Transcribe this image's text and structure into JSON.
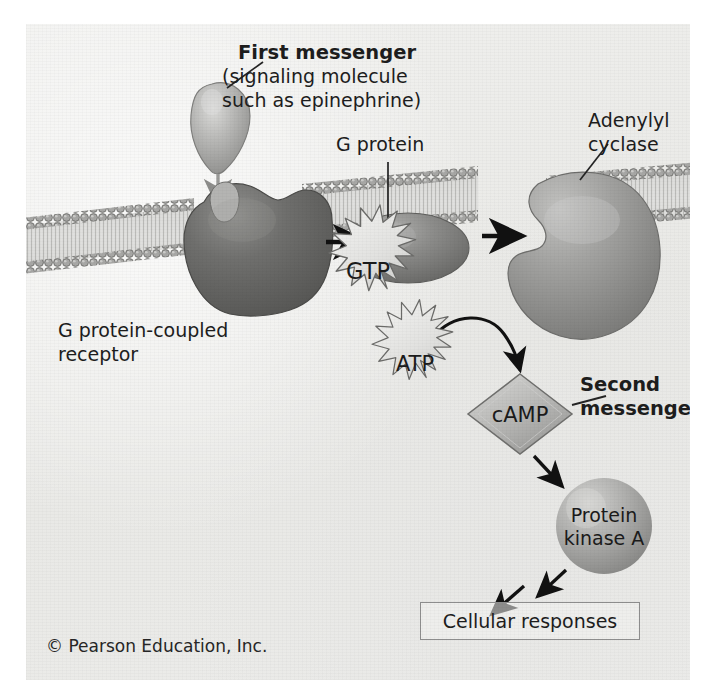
{
  "figure": {
    "background_color": "#eeeeec",
    "ink_color": "#1d1d1d"
  },
  "labels": {
    "first_messenger": {
      "line1": "First messenger",
      "line2": "(signaling molecule",
      "line3": "such as epinephrine)",
      "bold": "true"
    },
    "g_protein": "G protein",
    "adenylyl_cyclase": {
      "line1": "Adenylyl",
      "line2": "cyclase"
    },
    "receptor": {
      "line1": "G protein-coupled",
      "line2": "receptor"
    },
    "second_messenger": {
      "line1": "Second",
      "line2": "messenger",
      "bold": "true"
    },
    "cellular_responses": "Cellular responses",
    "copyright": "© Pearson Education, Inc."
  },
  "molecules": {
    "gtp": "GTP",
    "atp": "ATP",
    "camp": "cAMP",
    "protein_kinase_a": {
      "line1": "Protein",
      "line2": "kinase A"
    }
  },
  "colors": {
    "receptor_fill": "#6e6e6e",
    "g_protein_fill": "#8a8a8a",
    "adenylyl_cyclase_fill": "#9a9a9a",
    "ligand_fill": "#b4b4b4",
    "starburst_fill": "#e6e6e4",
    "camp_fill": "#b9b9b7",
    "kinase_fill": "#b0b0ae",
    "membrane_head": "#9b9b99",
    "arrow_black": "#111111",
    "box_border": "#8d8d8d"
  }
}
